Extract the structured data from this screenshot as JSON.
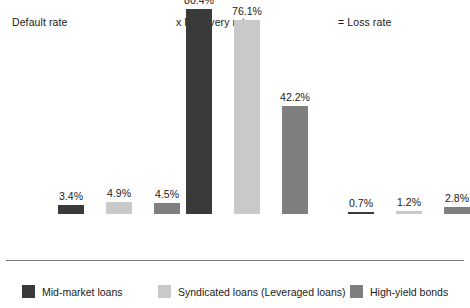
{
  "chart_data": {
    "type": "bar",
    "title": "",
    "subtitle": "",
    "xlabel": "",
    "ylabel": "",
    "grid": false,
    "legend_position": "bottom",
    "axis_visible": true,
    "ylim": [
      0,
      100
    ],
    "value_suffix": "%",
    "categories": [
      "Default rate",
      "x Recovery rate",
      "= Loss rate"
    ],
    "series": [
      {
        "name": "Mid-market loans",
        "color": "#3a3a3a",
        "values": [
          3.4,
          4.9,
          0.7
        ],
        "labels": [
          "3.4%",
          "4.9%",
          "0.7%"
        ]
      },
      {
        "name": "Syndicated loans (Leveraged loans)",
        "color": "#c9c9c9",
        "values": [
          null,
          80.4,
          null
        ],
        "labels": [
          null,
          "80.4%",
          null
        ]
      },
      {
        "name": "High-yield bonds",
        "color": "#7f7f7f",
        "values": [
          null,
          null,
          null
        ],
        "labels": [
          null,
          null,
          null
        ]
      }
    ],
    "groups": [
      {
        "label": "Default rate",
        "bars": [
          {
            "series": "Mid-market loans",
            "color": "#3a3a3a",
            "value": 3.4,
            "label": "3.4%"
          },
          {
            "series": "Syndicated loans (Leveraged loans)",
            "color": "#c9c9c9",
            "value": 4.9,
            "label": "4.9%"
          },
          {
            "series": "High-yield bonds",
            "color": "#7f7f7f",
            "value": 4.5,
            "label": "4.5%"
          }
        ]
      },
      {
        "label": "x Recovery rate",
        "bars": [
          {
            "series": "Mid-market loans",
            "color": "#3a3a3a",
            "value": 80.4,
            "label": "80.4%"
          },
          {
            "series": "Syndicated loans (Leveraged loans)",
            "color": "#c9c9c9",
            "value": 76.1,
            "label": "76.1%"
          },
          {
            "series": "High-yield bonds",
            "color": "#7f7f7f",
            "value": 42.2,
            "label": "42.2%"
          }
        ]
      },
      {
        "label": "= Loss rate",
        "bars": [
          {
            "series": "Mid-market loans",
            "color": "#3a3a3a",
            "value": 0.7,
            "label": "0.7%"
          },
          {
            "series": "Syndicated loans (Leveraged loans)",
            "color": "#c9c9c9",
            "value": 1.2,
            "label": "1.2%"
          },
          {
            "series": "High-yield bonds",
            "color": "#7f7f7f",
            "value": 2.8,
            "label": "2.8%"
          }
        ]
      }
    ]
  },
  "headers": [
    {
      "text": "Default rate"
    },
    {
      "text": "x Recovery rate"
    },
    {
      "text": "= Loss rate"
    }
  ],
  "legend": {
    "items": [
      {
        "label": "Mid-market loans",
        "color": "#3a3a3a"
      },
      {
        "label": "Syndicated loans (Leveraged loans)",
        "color": "#c9c9c9"
      },
      {
        "label": "High-yield bonds",
        "color": "#7f7f7f"
      }
    ]
  },
  "layout": {
    "baseline_y": 260,
    "px_per_percent": 2.55,
    "bar_width": 26,
    "group_starts": [
      58,
      186,
      348
    ],
    "bar_gap": 48
  }
}
